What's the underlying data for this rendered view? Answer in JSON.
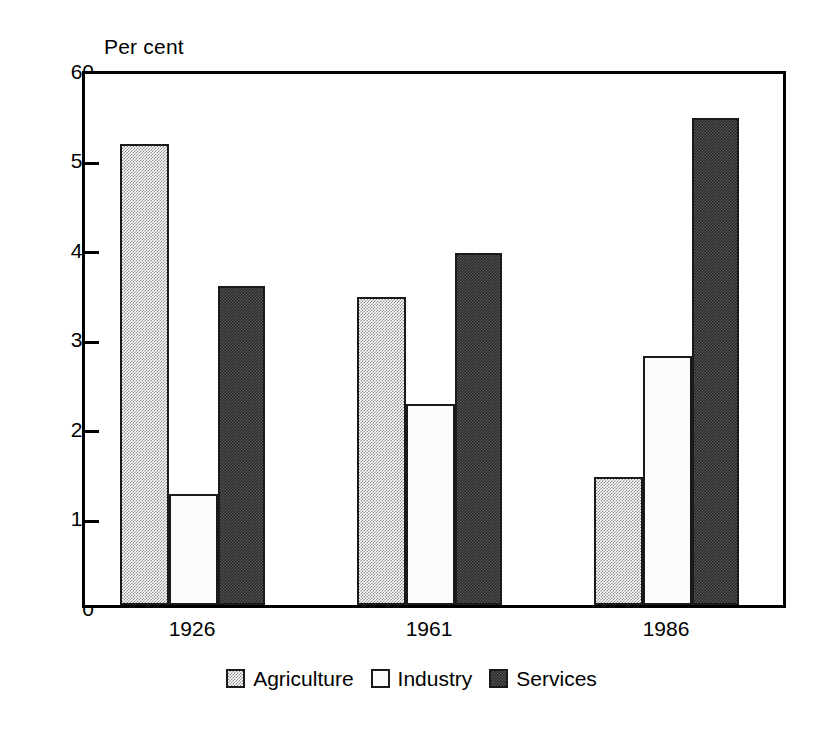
{
  "chart_data": {
    "type": "bar",
    "title": "",
    "subtitle": "",
    "xlabel": "",
    "ylabel": "Per cent",
    "ylim": [
      0,
      60
    ],
    "yticks": [
      0,
      10,
      20,
      30,
      40,
      50,
      60
    ],
    "ytick_labels": [
      "0",
      "10",
      "20",
      "30",
      "40",
      "50",
      "60"
    ],
    "grid": false,
    "legend_position": "bottom-center",
    "categories": [
      "1926",
      "1961",
      "1986"
    ],
    "series": [
      {
        "name": "Agriculture",
        "values": [
          52.1,
          34.8,
          14.5
        ],
        "color": "#9a9a9a",
        "fill": "light-dither"
      },
      {
        "name": "Industry",
        "values": [
          12.5,
          22.7,
          28.1
        ],
        "color": "#ffffff",
        "fill": "white"
      },
      {
        "name": "Services",
        "values": [
          36.0,
          39.8,
          55.0
        ],
        "color": "#333333",
        "fill": "dark-dither"
      }
    ],
    "annotations": []
  },
  "axis": {
    "caption": "Per cent",
    "tick_labels": [
      "60",
      "50",
      "40",
      "30",
      "20",
      "10",
      "0"
    ],
    "category_labels": [
      "1926",
      "1961",
      "1986"
    ]
  },
  "legend": {
    "entries": [
      {
        "label": "Agriculture",
        "swatch": "light-dither-swatch"
      },
      {
        "label": "Industry",
        "swatch": "white-swatch"
      },
      {
        "label": "Services",
        "swatch": "dark-dither-swatch"
      }
    ]
  },
  "colors": {
    "axis": "#000000",
    "bar_border": "#1a1a1a",
    "agriculture": "#9a9a9a",
    "industry": "#ffffff",
    "services": "#333333",
    "background": "#ffffff"
  }
}
